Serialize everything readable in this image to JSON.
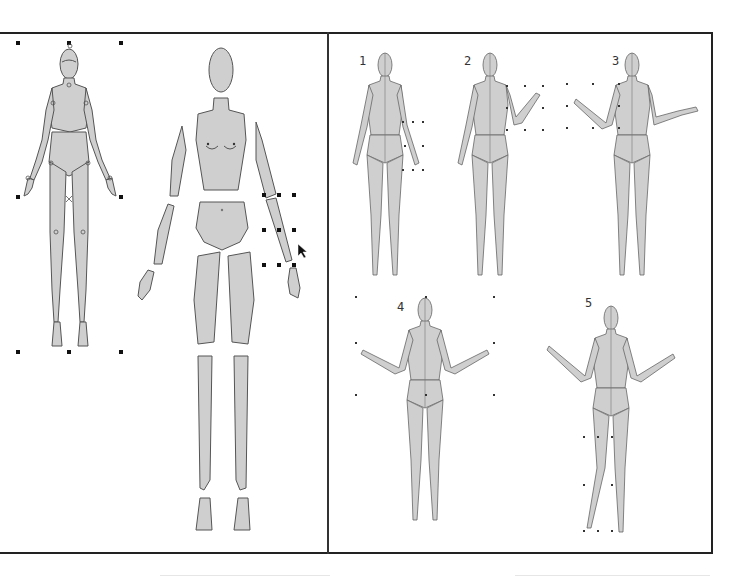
{
  "canvas": {
    "panels": [
      "assembled-figure-panel",
      "pose-variations-panel"
    ],
    "colors": {
      "body_fill": "#cfcfcf",
      "body_stroke": "#555555",
      "frame": "#222222",
      "handle": "#111111",
      "background": "#ffffff"
    }
  },
  "left_panel": {
    "assembled_figure": {
      "state": "selected",
      "handle_count": 8
    },
    "exploded_figure": {
      "parts": [
        "head",
        "torso",
        "left-upper-arm",
        "right-upper-arm",
        "left-forearm",
        "right-forearm",
        "left-hand",
        "right-hand",
        "pelvis",
        "left-thigh",
        "right-thigh",
        "left-shin",
        "right-shin",
        "left-foot",
        "right-foot"
      ],
      "selected_part": "right-forearm",
      "cursor": "arrow-pointer"
    }
  },
  "right_panel": {
    "poses": [
      {
        "label": "1",
        "description": "arms down, right forearm rotation handles"
      },
      {
        "label": "2",
        "description": "right forearm raised"
      },
      {
        "label": "3",
        "description": "both arms raised, left arm selected"
      },
      {
        "label": "4",
        "description": "both arms raised outward, whole figure selected"
      },
      {
        "label": "5",
        "description": "arms raised, left leg stepped forward"
      }
    ]
  }
}
